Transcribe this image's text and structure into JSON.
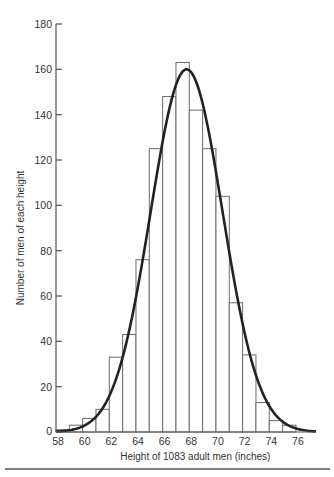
{
  "chart_data": {
    "type": "bar",
    "title": "",
    "xlabel": "Height of 1083 adult men (inches)",
    "ylabel": "Number of men of each height",
    "xlim": [
      58,
      77.5
    ],
    "ylim": [
      0,
      180
    ],
    "x_ticks": [
      58,
      60,
      62,
      64,
      66,
      68,
      70,
      72,
      74,
      76
    ],
    "y_ticks": [
      0,
      20,
      40,
      60,
      80,
      100,
      120,
      140,
      160,
      180
    ],
    "grid": false,
    "bins": [
      {
        "from": 58,
        "to": 59,
        "value": 1
      },
      {
        "from": 59,
        "to": 60,
        "value": 3
      },
      {
        "from": 60,
        "to": 61,
        "value": 6
      },
      {
        "from": 61,
        "to": 62,
        "value": 10
      },
      {
        "from": 62,
        "to": 63,
        "value": 33
      },
      {
        "from": 63,
        "to": 64,
        "value": 43
      },
      {
        "from": 64,
        "to": 65,
        "value": 76
      },
      {
        "from": 65,
        "to": 66,
        "value": 125
      },
      {
        "from": 66,
        "to": 67,
        "value": 148
      },
      {
        "from": 67,
        "to": 68,
        "value": 163
      },
      {
        "from": 68,
        "to": 69,
        "value": 142
      },
      {
        "from": 69,
        "to": 70,
        "value": 125
      },
      {
        "from": 70,
        "to": 71,
        "value": 104
      },
      {
        "from": 71,
        "to": 72,
        "value": 57
      },
      {
        "from": 72,
        "to": 73,
        "value": 34
      },
      {
        "from": 73,
        "to": 74,
        "value": 13
      },
      {
        "from": 74,
        "to": 75,
        "value": 5
      },
      {
        "from": 75,
        "to": 76,
        "value": 3
      }
    ],
    "fitted_curve": {
      "type": "normal",
      "mean": 67.8,
      "sd": 2.7,
      "peak": 160,
      "x_range": [
        58,
        77.5
      ]
    }
  }
}
